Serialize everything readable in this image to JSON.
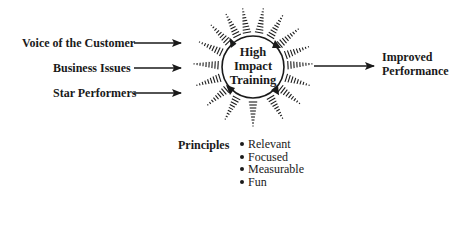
{
  "inputs": [
    {
      "label": "Voice of the Customer"
    },
    {
      "label": "Business Issues"
    },
    {
      "label": "Star Performers"
    }
  ],
  "center": {
    "lines": [
      "High",
      "Impact",
      "Training"
    ]
  },
  "output": {
    "lines": [
      "Improved",
      "Performance"
    ]
  },
  "principles": {
    "heading": "Principles",
    "items": [
      "Relevant",
      "Focused",
      "Measurable",
      "Fun"
    ]
  },
  "colors": {
    "ink": "#1a1a1a",
    "background": "#ffffff"
  }
}
